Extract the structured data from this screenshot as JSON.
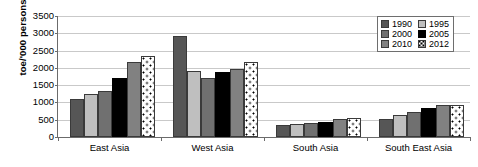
{
  "chart_data": {
    "type": "bar",
    "title": "",
    "subtitle": "",
    "xlabel": "",
    "ylabel": "toe/'000 persons",
    "ylim": [
      0,
      3500
    ],
    "ytick_step": 500,
    "yticks": [
      0,
      500,
      1000,
      1500,
      2000,
      2500,
      3000,
      3500
    ],
    "ytick_labels": [
      "0",
      "500",
      "1000",
      "1500",
      "2000",
      "2500",
      "3000",
      "3500"
    ],
    "categories": [
      "East Asia",
      "West Asia",
      "South Asia",
      "South East Asia"
    ],
    "grid": "horizontal",
    "legend_position": "top-right",
    "series": [
      {
        "name": "1990",
        "color": "#565656",
        "pattern": "solid",
        "values": [
          1090,
          2910,
          335,
          515
        ]
      },
      {
        "name": "1995",
        "color": "#bfbfbf",
        "pattern": "solid",
        "values": [
          1235,
          1920,
          375,
          645
        ]
      },
      {
        "name": "2000",
        "color": "#707070",
        "pattern": "solid",
        "values": [
          1320,
          1700,
          405,
          730
        ]
      },
      {
        "name": "2005",
        "color": "#000000",
        "pattern": "solid",
        "values": [
          1715,
          1885,
          445,
          830
        ]
      },
      {
        "name": "2010",
        "color": "#818181",
        "pattern": "solid",
        "values": [
          2165,
          1960,
          535,
          920
        ]
      },
      {
        "name": "2012",
        "color": "#ffffff",
        "pattern": "dotted",
        "values": [
          2350,
          2160,
          540,
          920
        ]
      }
    ]
  },
  "legend": {
    "entries": [
      {
        "label": "1990"
      },
      {
        "label": "1995"
      },
      {
        "label": "2000"
      },
      {
        "label": "2005"
      },
      {
        "label": "2010"
      },
      {
        "label": "2012"
      }
    ]
  }
}
